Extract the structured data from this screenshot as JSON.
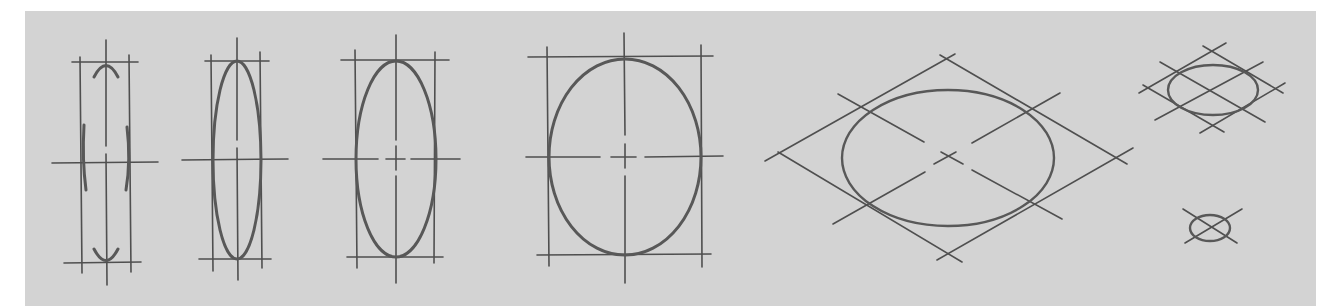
{
  "figure": {
    "background_color": "#d3d3d3",
    "stroke_color": "#555555",
    "sketches": [
      {
        "id": "ellipse-construction-marks",
        "center": [
          106,
          163
        ],
        "box": [
          80,
          62,
          129,
          263
        ],
        "stage": "tangent marks only"
      },
      {
        "id": "narrow-ellipse",
        "center": [
          237,
          160
        ],
        "rx": 24,
        "ry": 99
      },
      {
        "id": "medium-ellipse",
        "center": [
          396,
          159
        ],
        "rx": 40,
        "ry": 98
      },
      {
        "id": "wide-ellipse",
        "center": [
          625,
          157
        ],
        "rx": 76,
        "ry": 98
      },
      {
        "id": "ellipse-in-rhombus-large",
        "center": [
          948,
          158
        ],
        "rx": 106,
        "ry": 68
      },
      {
        "id": "ellipse-in-rhombus-small",
        "center": [
          1213,
          90
        ],
        "rx": 45,
        "ry": 25
      },
      {
        "id": "ellipse-in-cross-tiny",
        "center": [
          1210,
          228
        ],
        "rx": 20,
        "ry": 13
      }
    ]
  }
}
